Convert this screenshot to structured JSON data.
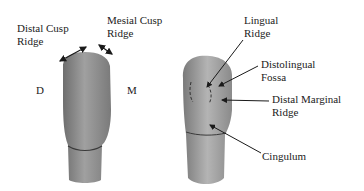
{
  "left_tooth": {
    "labels": {
      "distal_cusp_ridge_line1": "Distal Cusp",
      "distal_cusp_ridge_line2": "Ridge",
      "mesial_cusp_ridge_line1": "Mesial Cusp",
      "mesial_cusp_ridge_line2": "Ridge",
      "distal": "D",
      "mesial": "M"
    }
  },
  "right_tooth": {
    "labels": {
      "lingual_ridge_line1": "Lingual",
      "lingual_ridge_line2": "Ridge",
      "distolingual_fossa_line1": "Distolingual",
      "distolingual_fossa_line2": "Fossa",
      "distal_marginal_ridge_line1": "Distal Marginal",
      "distal_marginal_ridge_line2": "Ridge",
      "cingulum": "Cingulum"
    }
  },
  "colors": {
    "tooth_fill": "#8c8c8c",
    "tooth_light": "#b0b0b0",
    "arrow": "#1a1a1a",
    "text": "#222222"
  }
}
